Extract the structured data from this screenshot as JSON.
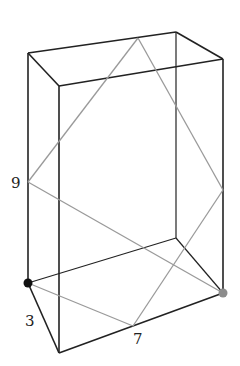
{
  "diagram": {
    "type": "rectangular-prism-path",
    "labels": {
      "height": "9",
      "width": "3",
      "length": "7"
    },
    "colors": {
      "edges": "#222222",
      "path": "#9a9a9a",
      "start_point": "#111111",
      "end_point": "#8c8c8c"
    },
    "vertices": {
      "back_top_left": [
        28,
        53
      ],
      "back_top_right": [
        176,
        32
      ],
      "front_top_left": [
        59,
        86
      ],
      "front_top_right": [
        223,
        59
      ],
      "back_bottom_left": [
        28,
        283
      ],
      "back_bottom_right": [
        176,
        238
      ],
      "front_bottom_left": [
        59,
        353
      ],
      "front_bottom_right": [
        223,
        293
      ]
    },
    "path_points": [
      [
        28,
        283
      ],
      [
        133,
        326
      ],
      [
        223,
        190
      ],
      [
        138,
        38
      ],
      [
        28,
        182
      ],
      [
        223,
        293
      ]
    ]
  }
}
